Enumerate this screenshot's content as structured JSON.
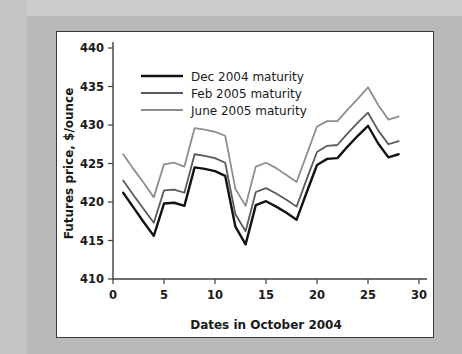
{
  "figure": {
    "background_color": "#b9b9b9",
    "panel_color": "#ffffff",
    "panel_border_color": "#3a3a3a"
  },
  "chart_data": {
    "type": "line",
    "title": "",
    "xlabel": "Dates in October 2004",
    "ylabel": "Futures price, $/ounce",
    "xlim": [
      0,
      30
    ],
    "ylim": [
      410,
      440
    ],
    "xticks": [
      0,
      5,
      10,
      15,
      20,
      25,
      30
    ],
    "xtick_labels": [
      "0",
      "5",
      "10",
      "15",
      "20",
      "25",
      "30"
    ],
    "yticks": [
      410,
      415,
      420,
      425,
      430,
      435,
      440
    ],
    "ytick_labels": [
      "410",
      "415",
      "420",
      "425",
      "430",
      "435",
      "440"
    ],
    "grid": false,
    "legend_position": "upper left",
    "x": [
      1,
      2,
      3,
      4,
      5,
      6,
      7,
      8,
      9,
      10,
      11,
      12,
      13,
      14,
      15,
      16,
      17,
      18,
      19,
      20,
      21,
      22,
      23,
      24,
      25,
      26,
      27,
      28
    ],
    "series": [
      {
        "name": "Dec 2004 maturity",
        "color": "#121212",
        "width": 2.4,
        "values": [
          421.2,
          419.3,
          417.4,
          415.6,
          419.8,
          419.9,
          419.5,
          424.5,
          424.3,
          424.0,
          423.4,
          416.8,
          414.5,
          419.6,
          420.1,
          419.4,
          418.6,
          417.7,
          421.3,
          424.8,
          425.6,
          425.7,
          427.2,
          428.6,
          429.9,
          427.6,
          425.8,
          426.2
        ]
      },
      {
        "name": "Feb 2005 maturity",
        "color": "#5a5a5a",
        "width": 1.8,
        "values": [
          422.8,
          420.9,
          419.1,
          417.3,
          421.5,
          421.6,
          421.2,
          426.2,
          426.0,
          425.7,
          425.1,
          418.4,
          416.2,
          421.3,
          421.8,
          421.1,
          420.3,
          419.4,
          423.0,
          426.5,
          427.3,
          427.4,
          428.9,
          430.3,
          431.6,
          429.3,
          427.5,
          427.9
        ]
      },
      {
        "name": "June 2005 maturity",
        "color": "#8e8e8e",
        "width": 1.8,
        "values": [
          426.2,
          424.3,
          422.5,
          420.6,
          424.9,
          425.1,
          424.6,
          429.6,
          429.4,
          429.1,
          428.6,
          421.7,
          419.5,
          424.6,
          425.1,
          424.4,
          423.5,
          422.6,
          426.2,
          429.8,
          430.5,
          430.5,
          432.0,
          433.4,
          434.9,
          432.6,
          430.7,
          431.1
        ]
      }
    ]
  }
}
